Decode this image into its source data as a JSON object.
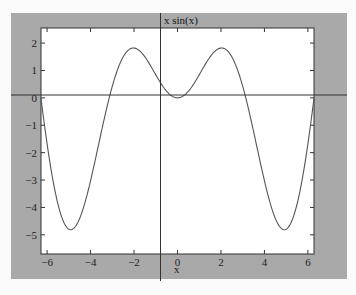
{
  "chart_data": {
    "type": "line",
    "title": "x sin(x)",
    "xlabel": "x",
    "ylabel": "",
    "function": "x*sin(x)",
    "xlim": [
      -6.28,
      6.28
    ],
    "ylim": [
      -5.7,
      2.55
    ],
    "xticks": [
      -6,
      -4,
      -2,
      0,
      2,
      4,
      6
    ],
    "xtick_labels": [
      "-6",
      "-4",
      "-2",
      "0",
      "2",
      "4",
      "6"
    ],
    "yticks": [
      2,
      1,
      0,
      -1,
      -2,
      -3,
      -4,
      -5
    ],
    "ytick_labels": [
      "2",
      "1",
      "0",
      "-1",
      "-2",
      "-3",
      "-4",
      "-5"
    ],
    "grid": false,
    "legend": "none",
    "series": [
      {
        "name": "x sin(x)",
        "x": [
          -6.28,
          -6.0,
          -5.5,
          -5.0,
          -4.91,
          -4.5,
          -4.0,
          -3.5,
          -3.14,
          -3.0,
          -2.5,
          -2.03,
          -1.5,
          -1.0,
          -0.5,
          0.0,
          0.5,
          1.0,
          1.5,
          2.03,
          2.5,
          3.0,
          3.14,
          3.5,
          4.0,
          4.5,
          4.91,
          5.0,
          5.5,
          6.0,
          6.28
        ],
        "y": [
          0.0,
          -1.68,
          -3.89,
          -4.79,
          -4.81,
          -4.4,
          -3.03,
          -1.23,
          0.0,
          0.42,
          1.5,
          1.82,
          1.5,
          0.84,
          0.24,
          0.0,
          0.24,
          0.84,
          1.5,
          1.82,
          1.5,
          0.42,
          0.0,
          -1.23,
          -3.03,
          -4.4,
          -4.81,
          -4.79,
          -3.89,
          -1.68,
          0.0
        ]
      }
    ]
  },
  "overlay": {
    "crosshair_x_label": "x sin(x)",
    "crosshair_y_label": "x"
  },
  "colors": {
    "frame_bg": "#a9a9a9",
    "plot_bg": "#ffffff",
    "line": "#555555",
    "axis": "#333333"
  }
}
